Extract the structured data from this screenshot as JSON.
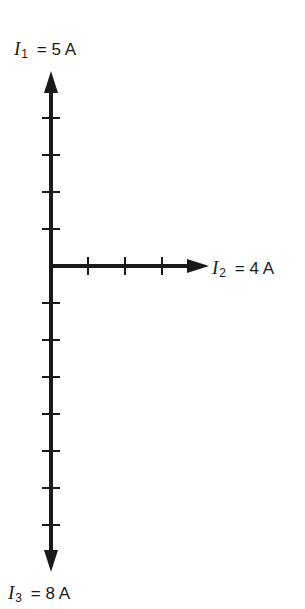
{
  "diagram": {
    "type": "phasor-diagram",
    "stroke_color": "#1a1a1a",
    "origin": {
      "x": 51,
      "y": 266
    },
    "scale_px_per_amp": 37,
    "vectors": [
      {
        "name": "I1",
        "symbol": "I",
        "subscript": "1",
        "equals": "=",
        "value": "5 A",
        "magnitude": 5,
        "direction": "up",
        "ticks": 4
      },
      {
        "name": "I2",
        "symbol": "I",
        "subscript": "2",
        "equals": "=",
        "value": "4 A",
        "magnitude": 4,
        "direction": "right",
        "ticks": 3
      },
      {
        "name": "I3",
        "symbol": "I",
        "subscript": "3",
        "equals": "=",
        "value": "8 A",
        "magnitude": 8,
        "direction": "down",
        "ticks": 7
      }
    ]
  },
  "labels": {
    "i1": {
      "symbol": "I",
      "subscript": "1",
      "text": "= 5 A"
    },
    "i2": {
      "symbol": "I",
      "subscript": "2",
      "text": "= 4 A"
    },
    "i3": {
      "symbol": "I",
      "subscript": "3",
      "text": "= 8 A"
    }
  }
}
